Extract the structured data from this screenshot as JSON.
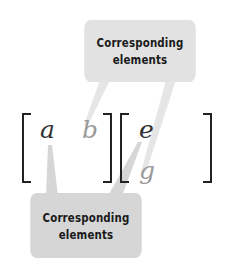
{
  "colors": {
    "callout_top_bg": "#e2e2e2",
    "callout_bottom_bg": "#d6d6d6",
    "leader_line": "#d8d8d8",
    "bracket": "#222222",
    "var_dark": "#333333",
    "var_light": "#9a9a9a"
  },
  "callouts": {
    "top": {
      "line1": "Corresponding",
      "line2": "elements"
    },
    "bottom": {
      "line1": "Corresponding",
      "line2": "elements"
    }
  },
  "matrix_left": {
    "entries": [
      {
        "symbol": "a",
        "row": 1,
        "col": 1,
        "emphasis": "dark"
      },
      {
        "symbol": "b",
        "row": 1,
        "col": 2,
        "emphasis": "light"
      }
    ]
  },
  "matrix_right": {
    "entries": [
      {
        "symbol": "e",
        "row": 1,
        "col": 1,
        "emphasis": "dark"
      },
      {
        "symbol": "g",
        "row": 2,
        "col": 1,
        "emphasis": "light"
      }
    ]
  }
}
